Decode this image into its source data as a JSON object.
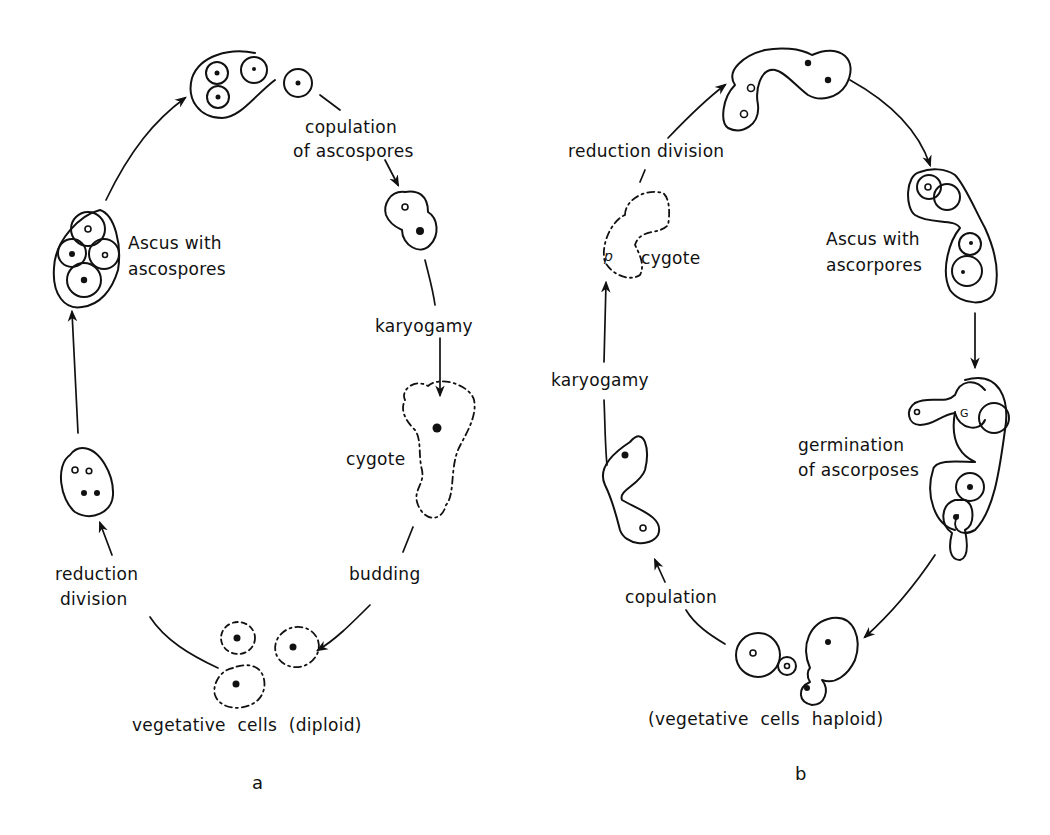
{
  "figure": {
    "panels": [
      {
        "id": "a",
        "letter": "a",
        "title": "Diploid yeast life cycle",
        "labels": {
          "copulation_line1": "copulation",
          "copulation_line2": "of ascospores",
          "karyogamy": "karyogamy",
          "cygote": "cygote",
          "budding": "budding",
          "vegetative": "vegetative cells (diploid)",
          "reduction_line1": "reduction",
          "reduction_line2": "division",
          "ascus_line1": "Ascus with",
          "ascus_line2": "ascospores"
        },
        "stages": [
          "Ascus with ascospores",
          "copulation of ascospores",
          "karyogamy",
          "cygote",
          "budding",
          "vegetative cells (diploid)",
          "reduction division"
        ]
      },
      {
        "id": "b",
        "letter": "b",
        "title": "Haploid yeast life cycle",
        "labels": {
          "reduction": "reduction division",
          "ascus_line1": "Ascus with",
          "ascus_line2": "ascorpores",
          "germination_line1": "germination",
          "germination_line2": "of ascorposes",
          "vegetative": "(vegetative cells haploid)",
          "copulation": "copulation",
          "karyogamy": "karyogamy",
          "cygote": "cygote"
        },
        "stages": [
          "reduction division",
          "Ascus with ascorpores",
          "germination of ascorposes",
          "vegetative cells haploid",
          "copulation",
          "karyogamy",
          "cygote"
        ]
      }
    ],
    "colors": {
      "ink": "#111111",
      "background": "#ffffff"
    }
  }
}
